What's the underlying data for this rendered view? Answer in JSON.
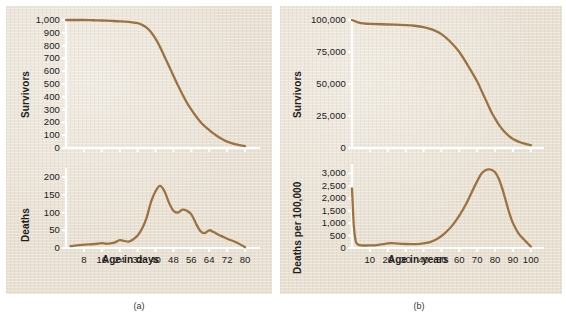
{
  "figure": {
    "captions": [
      {
        "id": "a",
        "text": "(a)"
      },
      {
        "id": "b",
        "text": "(b)"
      }
    ],
    "curve_color": "#9c7340",
    "paper_color": "#e8e0d2",
    "axis_color": "#ffffff"
  },
  "chart_data": [
    {
      "type": "line",
      "id": "panel-a-survivors",
      "title": "",
      "xlabel": "",
      "ylabel": "Survivors",
      "x": [
        0,
        4,
        8,
        12,
        16,
        20,
        24,
        28,
        32,
        34,
        36,
        38,
        40,
        42,
        44,
        46,
        48,
        50,
        52,
        54,
        56,
        58,
        60,
        62,
        64,
        66,
        68,
        70,
        72,
        74,
        76,
        78,
        80
      ],
      "values": [
        1000,
        1000,
        1000,
        998,
        996,
        993,
        990,
        985,
        975,
        962,
        940,
        905,
        855,
        790,
        715,
        640,
        565,
        490,
        420,
        355,
        300,
        250,
        205,
        170,
        140,
        112,
        88,
        68,
        50,
        38,
        28,
        20,
        15
      ],
      "xlim": [
        0,
        84
      ],
      "ylim": [
        0,
        1000
      ],
      "yticks": [
        0,
        100,
        200,
        300,
        400,
        500,
        600,
        700,
        800,
        900,
        1000
      ],
      "ytick_labels": [
        "0",
        "100",
        "200",
        "300",
        "400",
        "500",
        "600",
        "700",
        "800",
        "900",
        "1,000"
      ],
      "xticks": [
        8,
        16,
        24,
        32,
        40,
        48,
        56,
        64,
        72,
        80
      ],
      "xtick_labels": [
        "8",
        "16",
        "24",
        "32",
        "40",
        "48",
        "56",
        "64",
        "72",
        "80"
      ],
      "grid": false,
      "legend": "none"
    },
    {
      "type": "line",
      "id": "panel-a-deaths",
      "title": "",
      "xlabel": "Age in days",
      "ylabel": "Deaths",
      "x": [
        2,
        6,
        10,
        14,
        16,
        18,
        20,
        22,
        24,
        26,
        28,
        30,
        32,
        34,
        36,
        38,
        40,
        42,
        44,
        46,
        48,
        50,
        52,
        54,
        56,
        58,
        60,
        62,
        64,
        66,
        68,
        70,
        72,
        76,
        80
      ],
      "values": [
        5,
        8,
        10,
        12,
        14,
        12,
        13,
        16,
        22,
        20,
        18,
        24,
        35,
        55,
        85,
        130,
        160,
        175,
        160,
        128,
        105,
        100,
        108,
        105,
        95,
        70,
        48,
        42,
        50,
        45,
        38,
        32,
        26,
        16,
        2
      ],
      "xlim": [
        0,
        84
      ],
      "ylim": [
        0,
        220
      ],
      "yticks": [
        0,
        50,
        100,
        150,
        200
      ],
      "ytick_labels": [
        "0",
        "50",
        "100",
        "150",
        "200"
      ],
      "xticks": [
        8,
        16,
        24,
        32,
        40,
        48,
        56,
        64,
        72,
        80
      ],
      "xtick_labels": [
        "8",
        "16",
        "24",
        "32",
        "40",
        "48",
        "56",
        "64",
        "72",
        "80"
      ],
      "grid": false,
      "legend": "none"
    },
    {
      "type": "line",
      "id": "panel-b-survivors",
      "title": "",
      "xlabel": "",
      "ylabel": "Survivors",
      "x": [
        0,
        5,
        10,
        20,
        30,
        35,
        40,
        45,
        50,
        55,
        60,
        65,
        70,
        72,
        75,
        78,
        80,
        82,
        85,
        88,
        90,
        93,
        95,
        98,
        100
      ],
      "values": [
        100000,
        97500,
        97000,
        96500,
        96000,
        95500,
        94500,
        92500,
        89000,
        83000,
        75000,
        64000,
        52000,
        46000,
        37000,
        28000,
        23000,
        18500,
        13000,
        9000,
        7000,
        5000,
        4000,
        2800,
        2200
      ],
      "xlim": [
        0,
        104
      ],
      "ylim": [
        0,
        100000
      ],
      "yticks": [
        0,
        25000,
        50000,
        75000,
        100000
      ],
      "ytick_labels": [
        "0",
        "25,000",
        "50,000",
        "75,000",
        "100,000"
      ],
      "xticks": [
        10,
        20,
        30,
        40,
        50,
        60,
        70,
        80,
        90,
        100
      ],
      "xtick_labels": [
        "10",
        "20",
        "30",
        "40",
        "50",
        "60",
        "70",
        "80",
        "90",
        "100"
      ],
      "grid": false,
      "legend": "none"
    },
    {
      "type": "line",
      "id": "panel-b-deaths",
      "title": "",
      "xlabel": "Age in years",
      "ylabel": "Deaths per 100,000",
      "x": [
        0,
        1,
        2,
        3,
        5,
        8,
        10,
        14,
        18,
        20,
        22,
        24,
        26,
        30,
        34,
        38,
        40,
        44,
        48,
        52,
        56,
        60,
        64,
        68,
        72,
        74,
        76,
        78,
        80,
        82,
        84,
        86,
        88,
        90,
        93,
        96,
        100
      ],
      "values": [
        2400,
        900,
        300,
        160,
        110,
        100,
        105,
        120,
        160,
        185,
        195,
        190,
        175,
        160,
        155,
        165,
        185,
        250,
        380,
        600,
        900,
        1300,
        1800,
        2400,
        2950,
        3100,
        3160,
        3150,
        3050,
        2800,
        2400,
        1900,
        1400,
        1000,
        600,
        350,
        60
      ],
      "xlim": [
        0,
        104
      ],
      "ylim": [
        0,
        3300
      ],
      "yticks": [
        0,
        500,
        1000,
        1500,
        2000,
        2500,
        3000
      ],
      "ytick_labels": [
        "0",
        "500",
        "1,000",
        "1,500",
        "2,000",
        "2,500",
        "3,000"
      ],
      "xticks": [
        10,
        20,
        30,
        40,
        50,
        60,
        70,
        80,
        90,
        100
      ],
      "xtick_labels": [
        "10",
        "20",
        "30",
        "40",
        "50",
        "60",
        "70",
        "80",
        "90",
        "100"
      ],
      "grid": false,
      "legend": "none"
    }
  ]
}
